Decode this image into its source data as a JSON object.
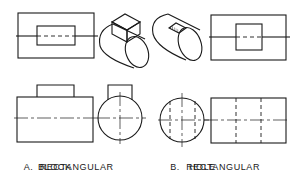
{
  "figure": {
    "caption_a": {
      "letter": "A.",
      "line1": "RECTANGULAR",
      "line2": "BLOCK"
    },
    "caption_b": {
      "letter": "B.",
      "line1": "RECTANGULAR",
      "line2": "HOLE"
    },
    "colors": {
      "line": "#1a1a1a",
      "background": "#ffffff"
    }
  }
}
